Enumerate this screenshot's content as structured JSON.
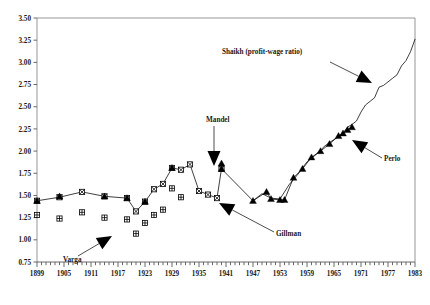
{
  "chart_data": {
    "type": "line",
    "title": "",
    "xlabel": "",
    "ylabel": "",
    "xlim": [
      1899,
      1983
    ],
    "ylim": [
      0.75,
      3.5
    ],
    "ytick_step": 0.25,
    "xtick_step": 6,
    "grid": false,
    "legend": "none (inline annotated labels with arrows)",
    "yticks": [
      "3.50",
      "3.25",
      "3.00",
      "2.75",
      "2.50",
      "2.25",
      "2.00",
      "1.75",
      "1.50",
      "1.25",
      "1.00",
      "0.75"
    ],
    "xticks": [
      "1899",
      "1905",
      "1911",
      "1917",
      "1923",
      "1929",
      "1935",
      "1941",
      "1947",
      "1953",
      "1959",
      "1965",
      "1971",
      "1977",
      "1983"
    ],
    "xminor_step": 1,
    "series": [
      {
        "name": "Gillman",
        "marker": "square-with-x",
        "line": true,
        "points": [
          {
            "x": 1899,
            "y": 1.44
          },
          {
            "x": 1904,
            "y": 1.48
          },
          {
            "x": 1909,
            "y": 1.54
          },
          {
            "x": 1914,
            "y": 1.49
          },
          {
            "x": 1919,
            "y": 1.47
          },
          {
            "x": 1921,
            "y": 1.32
          },
          {
            "x": 1923,
            "y": 1.43
          },
          {
            "x": 1925,
            "y": 1.57
          },
          {
            "x": 1927,
            "y": 1.63
          },
          {
            "x": 1929,
            "y": 1.81
          },
          {
            "x": 1931,
            "y": 1.79
          },
          {
            "x": 1933,
            "y": 1.85
          },
          {
            "x": 1935,
            "y": 1.55
          },
          {
            "x": 1937,
            "y": 1.51
          },
          {
            "x": 1939,
            "y": 1.47
          },
          {
            "x": 1940,
            "y": 1.8
          }
        ]
      },
      {
        "name": "Varga",
        "marker": "crossed-square",
        "line": false,
        "points": [
          {
            "x": 1899,
            "y": 1.28
          },
          {
            "x": 1904,
            "y": 1.24
          },
          {
            "x": 1909,
            "y": 1.31
          },
          {
            "x": 1914,
            "y": 1.25
          },
          {
            "x": 1919,
            "y": 1.23
          },
          {
            "x": 1921,
            "y": 1.07
          },
          {
            "x": 1923,
            "y": 1.19
          },
          {
            "x": 1925,
            "y": 1.28
          },
          {
            "x": 1927,
            "y": 1.34
          },
          {
            "x": 1929,
            "y": 1.58
          },
          {
            "x": 1931,
            "y": 1.48
          }
        ]
      },
      {
        "name": "Mandel",
        "marker": "solid-triangle",
        "line": false,
        "points": [
          {
            "x": 1899,
            "y": 1.44
          },
          {
            "x": 1904,
            "y": 1.49
          },
          {
            "x": 1914,
            "y": 1.49
          },
          {
            "x": 1919,
            "y": 1.47
          },
          {
            "x": 1923,
            "y": 1.43
          },
          {
            "x": 1929,
            "y": 1.81
          },
          {
            "x": 1940,
            "y": 1.86
          }
        ]
      },
      {
        "name": "Perlo",
        "marker": "solid-triangle",
        "line": true,
        "points": [
          {
            "x": 1940,
            "y": 1.8
          },
          {
            "x": 1947,
            "y": 1.44
          },
          {
            "x": 1950,
            "y": 1.54
          },
          {
            "x": 1951,
            "y": 1.46
          },
          {
            "x": 1953,
            "y": 1.45
          },
          {
            "x": 1954,
            "y": 1.45
          },
          {
            "x": 1956,
            "y": 1.7
          },
          {
            "x": 1958,
            "y": 1.8
          },
          {
            "x": 1960,
            "y": 1.93
          },
          {
            "x": 1962,
            "y": 2.0
          },
          {
            "x": 1964,
            "y": 2.08
          },
          {
            "x": 1966,
            "y": 2.17
          },
          {
            "x": 1967,
            "y": 2.2
          },
          {
            "x": 1968,
            "y": 2.24
          },
          {
            "x": 1969,
            "y": 2.27
          }
        ]
      },
      {
        "name": "Shaikh (profit-wage ratio)",
        "marker": "none",
        "line": true,
        "points": [
          {
            "x": 1947,
            "y": 1.44
          },
          {
            "x": 1949,
            "y": 1.52
          },
          {
            "x": 1951,
            "y": 1.47
          },
          {
            "x": 1953,
            "y": 1.46
          },
          {
            "x": 1955,
            "y": 1.62
          },
          {
            "x": 1957,
            "y": 1.74
          },
          {
            "x": 1959,
            "y": 1.88
          },
          {
            "x": 1961,
            "y": 1.96
          },
          {
            "x": 1963,
            "y": 2.06
          },
          {
            "x": 1965,
            "y": 2.13
          },
          {
            "x": 1967,
            "y": 2.2
          },
          {
            "x": 1968,
            "y": 2.27
          },
          {
            "x": 1969,
            "y": 2.3
          },
          {
            "x": 1970,
            "y": 2.34
          },
          {
            "x": 1971,
            "y": 2.44
          },
          {
            "x": 1972,
            "y": 2.52
          },
          {
            "x": 1973,
            "y": 2.56
          },
          {
            "x": 1974,
            "y": 2.6
          },
          {
            "x": 1975,
            "y": 2.72
          },
          {
            "x": 1976,
            "y": 2.74
          },
          {
            "x": 1977,
            "y": 2.78
          },
          {
            "x": 1978,
            "y": 2.82
          },
          {
            "x": 1979,
            "y": 2.86
          },
          {
            "x": 1980,
            "y": 2.96
          },
          {
            "x": 1981,
            "y": 3.02
          },
          {
            "x": 1982,
            "y": 3.12
          },
          {
            "x": 1983,
            "y": 3.26
          }
        ]
      }
    ],
    "annotations": [
      {
        "name": "Varga",
        "label": "Varga",
        "text_x": 63,
        "text_y": 262,
        "arrow_from": [
          78,
          256
        ],
        "arrow_to": [
          112,
          236
        ]
      },
      {
        "name": "Mandel",
        "label": "Mandel",
        "text_x": 206,
        "text_y": 122,
        "arrow_from": [
          214,
          126
        ],
        "arrow_to": [
          214,
          166
        ]
      },
      {
        "name": "Gillman",
        "label": "Gillman",
        "text_x": 276,
        "text_y": 236,
        "arrow_from": [
          274,
          232
        ],
        "arrow_to": [
          219,
          203
        ]
      },
      {
        "name": "Shaikh",
        "label": "Shaikh (profit-wage ratio)",
        "text_x": 222,
        "text_y": 54,
        "arrow_from": [
          330,
          62
        ],
        "arrow_to": [
          372,
          83
        ]
      },
      {
        "name": "Perlo",
        "label": "Perlo",
        "text_x": 384,
        "text_y": 161,
        "arrow_from": [
          382,
          158
        ],
        "arrow_to": [
          352,
          140
        ]
      }
    ]
  }
}
